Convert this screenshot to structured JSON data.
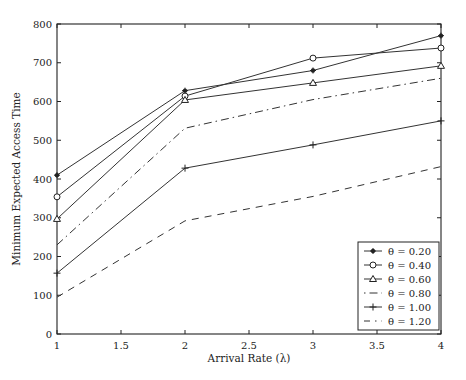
{
  "chart_data": {
    "type": "line",
    "title": "",
    "xlabel": "Arrival Rate (λ)",
    "ylabel": "Minimum Expected Access Time",
    "x": [
      1,
      2,
      3,
      4
    ],
    "xlim": [
      1,
      4
    ],
    "ylim": [
      0,
      800
    ],
    "xticks": [
      "1",
      "1.5",
      "2",
      "2.5",
      "3",
      "3.5",
      "4"
    ],
    "yticks": [
      "0",
      "100",
      "200",
      "300",
      "400",
      "500",
      "600",
      "700",
      "800"
    ],
    "grid": false,
    "legend_position": "lower right",
    "series": [
      {
        "name": "θ = 0.20",
        "marker": "asterisk",
        "style": "solid",
        "values": [
          410,
          628,
          680,
          770
        ]
      },
      {
        "name": "θ = 0.40",
        "marker": "circle",
        "style": "solid",
        "values": [
          354,
          614,
          712,
          738
        ]
      },
      {
        "name": "θ = 0.60",
        "marker": "triangle",
        "style": "solid",
        "values": [
          297,
          604,
          648,
          692
        ]
      },
      {
        "name": "θ = 0.80",
        "marker": "none",
        "style": "dashdot",
        "values": [
          230,
          531,
          605,
          660
        ]
      },
      {
        "name": "θ = 1.00",
        "marker": "plus",
        "style": "solid",
        "values": [
          157,
          428,
          488,
          550
        ]
      },
      {
        "name": "θ = 1.20",
        "marker": "none",
        "style": "dashed",
        "values": [
          95,
          292,
          355,
          432
        ]
      }
    ]
  }
}
